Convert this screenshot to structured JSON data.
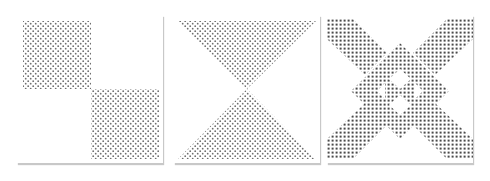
{
  "figure": {
    "panels": [
      {
        "id": "checkerboard",
        "description": "Two dotted quadrants (top-left, bottom-right)"
      },
      {
        "id": "hourglass",
        "description": "Two dotted triangles meeting at center"
      },
      {
        "id": "diamond-x",
        "description": "Dotted X with central diamond and inner holes"
      }
    ],
    "colors": {
      "dot": "#6e6e6e",
      "dot_dark": "#444444",
      "background": "#ffffff",
      "shadow": "#c8c8c8"
    }
  }
}
